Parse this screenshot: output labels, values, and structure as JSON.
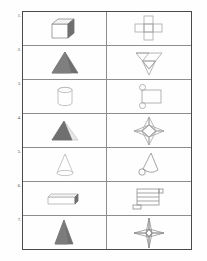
{
  "worksheet": {
    "title": "Solids and their nets matching table",
    "columns": [
      "3D solid",
      "2D net"
    ],
    "stroke_color": "#8d8d8d",
    "border_color": "#4a4a4a",
    "fill_gray": "#7b7b7b",
    "light_gray": "#c9c9c9",
    "rows": [
      {
        "number": "1.",
        "solid": {
          "name": "cube",
          "label": "cube"
        },
        "net": {
          "name": "cube-net",
          "label": "cross net of six squares"
        }
      },
      {
        "number": "2.",
        "solid": {
          "name": "triangular-pyramid",
          "label": "shaded triangular pyramid"
        },
        "net": {
          "name": "triangular-pyramid-net",
          "label": "net of four triangles"
        }
      },
      {
        "number": "3.",
        "solid": {
          "name": "cylinder",
          "label": "cylinder"
        },
        "net": {
          "name": "cylinder-net",
          "label": "rectangle with two circles"
        }
      },
      {
        "number": "4.",
        "solid": {
          "name": "square-pyramid",
          "label": "shaded square pyramid"
        },
        "net": {
          "name": "square-pyramid-net",
          "label": "square with four triangular flaps"
        }
      },
      {
        "number": "5.",
        "solid": {
          "name": "cone",
          "label": "cone"
        },
        "net": {
          "name": "cone-net",
          "label": "sector with small circle"
        }
      },
      {
        "number": "6.",
        "solid": {
          "name": "rectangular-prism",
          "label": "long rectangular prism"
        },
        "net": {
          "name": "rectangular-prism-net",
          "label": "stacked rectangles net"
        }
      },
      {
        "number": "7.",
        "solid": {
          "name": "tall-pyramid",
          "label": "tall shaded pyramid"
        },
        "net": {
          "name": "tall-pyramid-net",
          "label": "narrow four-point star net"
        }
      }
    ]
  }
}
